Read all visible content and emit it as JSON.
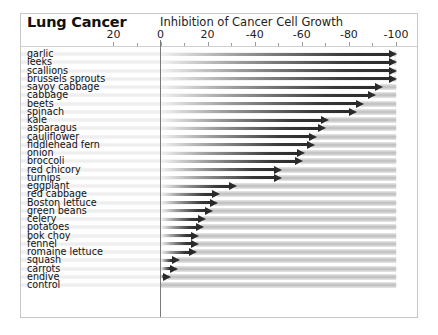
{
  "chart_data": {
    "type": "bar",
    "orientation": "horizontal",
    "title": "Lung Cancer",
    "xlabel": "Inhibition of Cancer Cell Growth",
    "ylabel": "",
    "xlim": [
      20,
      -100
    ],
    "x_ticks": [
      20,
      0,
      -20,
      -40,
      -60,
      -80,
      -100
    ],
    "x_tick_labels": [
      "20",
      "0",
      "20",
      "-40",
      "-60",
      "-80",
      "-100"
    ],
    "grid": false,
    "legend": null,
    "categories": [
      "garlic",
      "leeks",
      "scallions",
      "brussels sprouts",
      "savoy cabbage",
      "cabbage",
      "beets",
      "spinach",
      "kale",
      "asparagus",
      "cauliflower",
      "fiddlehead fern",
      "onion",
      "broccoli",
      "red chicory",
      "turnips",
      "eggplant",
      "red cabbage",
      "Boston lettuce",
      "green beans",
      "celery",
      "potatoes",
      "bok choy",
      "fennel",
      "romaine lettuce",
      "squash",
      "carrots",
      "endive",
      "control"
    ],
    "values": [
      -100,
      -100,
      -100,
      -100,
      -94,
      -91,
      -86,
      -83,
      -71,
      -70,
      -66,
      -65,
      -61,
      -60,
      -51,
      -51,
      -32,
      -25,
      -24,
      -22,
      -19,
      -18,
      -16,
      -16,
      -15,
      -8,
      -7,
      -4,
      0
    ]
  },
  "colors": {
    "arrow_dark": "#2a2a2a",
    "frame_border": "#c8c8c8",
    "stripe": "#bdbdbd"
  }
}
